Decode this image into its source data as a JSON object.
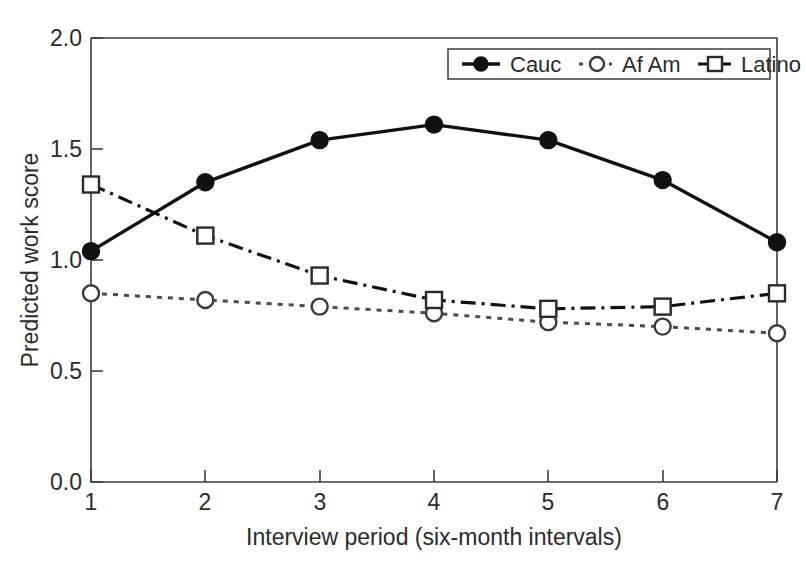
{
  "figure": {
    "background_color": "#ffffff",
    "ink_color": "#111111"
  },
  "chart_data": {
    "type": "line",
    "title": "",
    "xlabel": "Interview period (six-month intervals)",
    "ylabel": "Predicted work score",
    "x": [
      1,
      2,
      3,
      4,
      5,
      6,
      7
    ],
    "xtick_labels": [
      "1",
      "2",
      "3",
      "4",
      "5",
      "6",
      "7"
    ],
    "ytick_labels": [
      "0.0",
      "0.5",
      "1.0",
      "1.5",
      "2.0"
    ],
    "yticks": [
      0.0,
      0.5,
      1.0,
      1.5,
      2.0
    ],
    "xlim": [
      1,
      7
    ],
    "ylim": [
      0.0,
      2.0
    ],
    "grid": false,
    "legend_position": "top-right",
    "series": [
      {
        "name": "Cauc",
        "values": [
          1.04,
          1.35,
          1.54,
          1.61,
          1.54,
          1.36,
          1.08
        ],
        "marker": "filled-circle",
        "line_style": "solid",
        "color": "#111111"
      },
      {
        "name": "Af Am",
        "values": [
          0.85,
          0.82,
          0.79,
          0.76,
          0.72,
          0.7,
          0.67
        ],
        "marker": "open-circle",
        "line_style": "dotted",
        "color": "#4a4a4a"
      },
      {
        "name": "Latino",
        "values": [
          1.34,
          1.11,
          0.93,
          0.82,
          0.78,
          0.79,
          0.85
        ],
        "marker": "open-square",
        "line_style": "dash-dot",
        "color": "#111111"
      }
    ]
  },
  "legend": {
    "entries": [
      {
        "label": "Cauc"
      },
      {
        "label": "Af Am"
      },
      {
        "label": "Latino"
      }
    ]
  }
}
